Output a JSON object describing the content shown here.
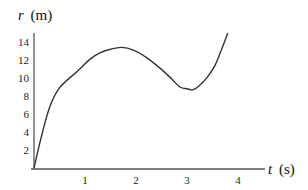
{
  "chart_data": {
    "type": "line",
    "title": "",
    "xlabel": "t (s)",
    "xlabel_var": "t",
    "xlabel_unit": "(s)",
    "ylabel": "r (m)",
    "ylabel_var": "r",
    "ylabel_unit": "(m)",
    "xlim": [
      0,
      4.5
    ],
    "ylim": [
      0,
      15
    ],
    "xticks": [
      1,
      2,
      3,
      4
    ],
    "yticks": [
      2,
      4,
      6,
      8,
      10,
      12,
      14
    ],
    "grid": false,
    "legend": null,
    "series": [
      {
        "name": "r(t)",
        "x": [
          0,
          0.15,
          0.31,
          0.5,
          0.84,
          1.1,
          1.29,
          1.5,
          1.72,
          1.95,
          2.2,
          2.47,
          2.7,
          2.86,
          3.0,
          3.12,
          3.25,
          3.4,
          3.55,
          3.7,
          3.8
        ],
        "y": [
          0,
          3.6,
          6.8,
          8.9,
          10.7,
          12.1,
          12.8,
          13.2,
          13.4,
          13.1,
          12.3,
          11.1,
          9.9,
          9.0,
          8.8,
          8.7,
          9.2,
          10.1,
          11.4,
          13.5,
          15.0
        ]
      }
    ]
  },
  "colors": {
    "axis": "#555555",
    "curve": "#333333",
    "text": "#222222"
  }
}
